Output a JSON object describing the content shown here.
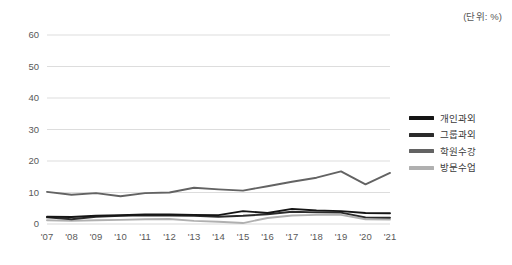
{
  "annotation": {
    "unit_note": "(단위: %)"
  },
  "legend": {
    "position": "right",
    "items": [
      {
        "label": "개인과외",
        "color": "#151515"
      },
      {
        "label": "그룹과외",
        "color": "#2b2b2b"
      },
      {
        "label": "학원수강",
        "color": "#636363"
      },
      {
        "label": "방문수업",
        "color": "#b0b0b0"
      }
    ]
  },
  "chart_data": {
    "type": "line",
    "title": "",
    "subtitle": "",
    "xlabel": "",
    "ylabel": "",
    "unit": "(단위: %)",
    "grid": true,
    "legend_position": "right",
    "ylim": [
      0,
      60
    ],
    "yticks": [
      0,
      10,
      20,
      30,
      40,
      50,
      60
    ],
    "categories": [
      "'07",
      "'08",
      "'09",
      "'10",
      "'11",
      "'12",
      "'13",
      "'14",
      "'15",
      "'16",
      "'17",
      "'18",
      "'19",
      "'20",
      "'21"
    ],
    "series": [
      {
        "name": "개인과외",
        "color": "#151515",
        "values": [
          2.3,
          2.2,
          2.6,
          2.8,
          3.0,
          3.0,
          2.9,
          2.8,
          4.1,
          3.5,
          4.8,
          4.3,
          4.1,
          3.5,
          3.4
        ]
      },
      {
        "name": "그룹과외",
        "color": "#2b2b2b",
        "values": [
          2.1,
          1.5,
          2.3,
          2.6,
          2.8,
          2.7,
          2.6,
          2.3,
          2.6,
          3.1,
          3.9,
          3.7,
          3.6,
          2.1,
          2.0
        ]
      },
      {
        "name": "학원수강",
        "color": "#636363",
        "values": [
          10.2,
          9.3,
          9.8,
          8.8,
          9.8,
          10.0,
          11.5,
          11.0,
          10.6,
          12.0,
          13.4,
          14.7,
          16.7,
          12.6,
          16.2
        ]
      },
      {
        "name": "방문수업",
        "color": "#b0b0b0",
        "values": [
          1.2,
          1.0,
          1.2,
          1.3,
          1.5,
          1.6,
          1.0,
          0.7,
          0.3,
          1.9,
          2.7,
          2.9,
          2.9,
          1.5,
          1.4
        ]
      }
    ]
  }
}
